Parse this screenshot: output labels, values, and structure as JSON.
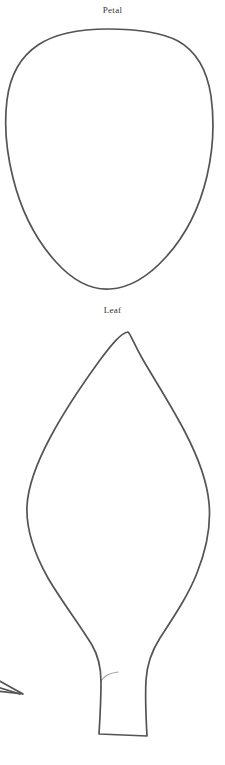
{
  "page": {
    "background_color": "#ffffff",
    "width": 225,
    "height": 765,
    "media": "scanned line-art template sheet"
  },
  "style": {
    "stroke_color": "#565452",
    "label_color": "#35322f",
    "stroke_width": 1.7,
    "fill": "none"
  },
  "shapes": [
    {
      "id": "petal",
      "label": "Petal",
      "label_position": {
        "x": 112,
        "y": 10
      },
      "description": "hand-drawn rounded shield / inverted teardrop petal outline",
      "bounds": {
        "left": 5,
        "top": 28,
        "right": 213,
        "bottom": 290
      },
      "width": 208,
      "height": 262,
      "apex": {
        "x": 110,
        "y": 289
      },
      "path": "M 108 29 C 82 29 56 33 38 45 C 20 57 10 76 7 100 C 4 124 6 150 13 178 C 21 210 36 240 56 262 C 74 282 93 290 110 289 C 128 288 148 277 166 257 C 186 235 200 206 207 176 C 214 146 214 118 211 96 C 207 70 196 51 178 41 C 159 31 134 29 108 29 Z"
    },
    {
      "id": "leaf",
      "label": "Leaf",
      "label_position": {
        "x": 112,
        "y": 310
      },
      "description": "hand-drawn pointed ovate leaf outline with straight stem and flat cut base",
      "bounds": {
        "left": 26,
        "top": 331,
        "right": 210,
        "bottom": 737
      },
      "width": 184,
      "height": 406,
      "apex": {
        "x": 128,
        "y": 331
      },
      "stem": {
        "top_y": 660,
        "base_y": 736,
        "left_x": 99,
        "right_x": 148
      },
      "path": "M 128 332 C 121 333 112 344 100 360 C 84 382 66 408 51 436 C 37 462 28 486 27 506 C 26 528 34 553 48 578 C 62 602 80 625 92 645 C 99 657 101 668 101 682 C 101 700 100 718 99 734 L 147 736 C 146 718 145 698 146 680 C 147 664 151 652 160 638 C 173 618 188 596 197 573 C 207 548 211 524 209 503 C 207 481 198 457 185 432 C 171 405 154 379 142 358 C 134 344 130 333 128 332 Z",
      "stem_accent_path": "M 101 681 C 104 676 110 673 118 672"
    },
    {
      "id": "clipped-fragment",
      "label": "",
      "description": "partially visible pointed tip of an adjacent shape clipped by the left page edge",
      "bounds": {
        "left": 0,
        "top": 679,
        "right": 24,
        "bottom": 697
      },
      "path": "M -6 678 L 23 694 L -4 691",
      "path_secondary": "M -6 686 L 20 694"
    }
  ]
}
